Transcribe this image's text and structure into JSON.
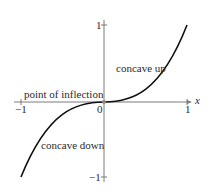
{
  "figure": {
    "function": "y = x^3",
    "x_axis": {
      "label": "x",
      "min": -1,
      "max": 1,
      "ticks": [
        {
          "value": -1,
          "label": "−1"
        },
        {
          "value": 0,
          "label": "0"
        },
        {
          "value": 1,
          "label": "1"
        }
      ]
    },
    "y_axis": {
      "min": -1,
      "max": 1,
      "ticks": [
        {
          "value": 1,
          "label": "1"
        },
        {
          "value": -1,
          "label": "−1"
        }
      ]
    },
    "annotations": {
      "inflection": "point of inflection",
      "concave_up": "concave up",
      "concave_down": "concave down"
    },
    "colors": {
      "curve": "#111111",
      "axis": "#7a7a7a",
      "text": "#2a2a2a",
      "inflection_point": "#8a8a8a"
    }
  }
}
